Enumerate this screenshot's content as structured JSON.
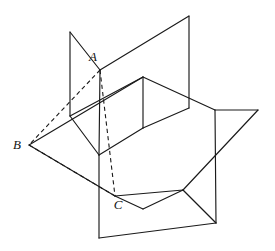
{
  "figure": {
    "name": "three-intersecting-planes-with-triangle-abc",
    "background_color": "#ffffff",
    "stroke_color": "#1a1a1a",
    "label_color": "#141414",
    "width": 275,
    "height": 251,
    "labels": [
      {
        "text": "A",
        "x": 93,
        "y": 58,
        "name": "vertex-label-a"
      },
      {
        "text": "B",
        "x": 17,
        "y": 146,
        "name": "vertex-label-b"
      },
      {
        "text": "C",
        "x": 118,
        "y": 206,
        "name": "vertex-label-c"
      }
    ],
    "vertices": {
      "A": {
        "x": 100,
        "y": 70
      },
      "B": {
        "x": 29,
        "y": 145
      },
      "C": {
        "x": 115,
        "y": 196
      }
    },
    "solid_paths": [
      {
        "name": "plane-back-left-vertical",
        "d": "M 70 32 L 70 116 L 143 128 L 143 76 Z"
      },
      {
        "name": "plane-tall-back-right-vertical",
        "d": "M 100 70 L 189 16 L 189 108 L 143 128"
      },
      {
        "name": "plane-tall-back-right-lower-edge",
        "d": "M 100 70 L 99 155"
      },
      {
        "name": "plane-horizontal-middle",
        "d": "M 29 145 L 115 196 L 258 110 L 143 64"
      },
      {
        "name": "plane-horizontal-middle-left-edge",
        "d": "M 29 145 L 143 76"
      },
      {
        "name": "plane-front-right-vertical",
        "d": "M 143 76 L 215 110 L 215 223 L 99 155 Z"
      },
      {
        "name": "plane-bottom-front-vertical",
        "d": "M 99 155 L 99 238 L 216 223"
      },
      {
        "name": "plane-bottom-front-lower-edge",
        "d": "M 99 238 L 183 190"
      },
      {
        "name": "plane-right-wing-edge",
        "d": "M 189 108 L 258 110"
      },
      {
        "name": "plane-right-wing-lower",
        "d": "M 215 110 L 258 110"
      },
      {
        "name": "plane-horizontal-front-right-edge",
        "d": "M 115 196 L 183 190"
      },
      {
        "name": "plane-horizontal-inner-notch",
        "d": "M 143 128 L 215 110"
      }
    ],
    "dashed_paths": [
      {
        "name": "segment-a-b",
        "d": "M 100 70 L 29 145"
      },
      {
        "name": "segment-b-c",
        "d": "M 29 145 L 115 196"
      },
      {
        "name": "segment-a-c",
        "d": "M 100 70 L 115 196"
      }
    ]
  }
}
